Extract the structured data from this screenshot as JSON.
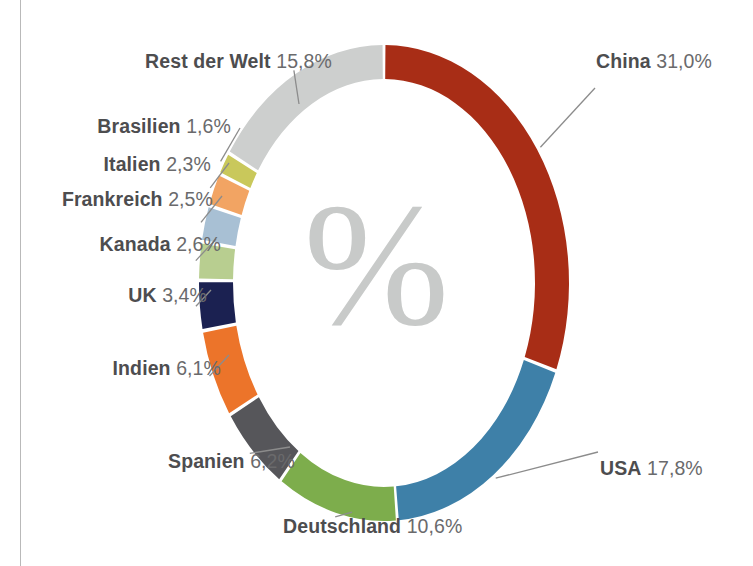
{
  "figure": {
    "center_glyph": "%",
    "background": "#ffffff",
    "rule_color": "#b9b9b9"
  },
  "chart_data": {
    "type": "pie",
    "variant": "donut",
    "title": "",
    "subtitle": "",
    "xlabel": "",
    "ylabel": "",
    "units": "%",
    "decimal_separator": ",",
    "start_angle_deg": 0,
    "direction": "clockwise",
    "inner_radius_ratio": 0.855,
    "total": 100.0,
    "legend": "none (direct labels with leader lines)",
    "grid": false,
    "center_label": "%",
    "categories": [
      "China",
      "USA",
      "Deutschland",
      "Spanien",
      "Indien",
      "UK",
      "Kanada",
      "Frankreich",
      "Italien",
      "Brasilien",
      "Rest der Welt"
    ],
    "values": [
      31.0,
      17.8,
      10.6,
      6.2,
      6.1,
      3.4,
      2.6,
      2.5,
      2.3,
      1.6,
      15.8
    ],
    "colors": [
      "#a82d16",
      "#3e80a8",
      "#7dad4c",
      "#56565a",
      "#ec742a",
      "#1b2151",
      "#b8ce90",
      "#a8c0d4",
      "#f2a463",
      "#c9c85b",
      "#cdcfce"
    ],
    "slices": [
      {
        "name": "China",
        "value": 31.0,
        "value_text": "31,0%",
        "label": "China 31,0%",
        "color": "#a82d16",
        "side": "right"
      },
      {
        "name": "USA",
        "value": 17.8,
        "value_text": "17,8%",
        "label": "USA 17,8%",
        "color": "#3e80a8",
        "side": "right"
      },
      {
        "name": "Deutschland",
        "value": 10.6,
        "value_text": "10,6%",
        "label": "Deutschland 10,6%",
        "color": "#7dad4c",
        "side": "bottom"
      },
      {
        "name": "Spanien",
        "value": 6.2,
        "value_text": "6,2%",
        "label": "Spanien 6,2%",
        "color": "#56565a",
        "side": "left"
      },
      {
        "name": "Indien",
        "value": 6.1,
        "value_text": "6,1%",
        "label": "Indien 6,1%",
        "color": "#ec742a",
        "side": "left"
      },
      {
        "name": "UK",
        "value": 3.4,
        "value_text": "3,4%",
        "label": "UK 3,4%",
        "color": "#1b2151",
        "side": "left"
      },
      {
        "name": "Kanada",
        "value": 2.6,
        "value_text": "2,6%",
        "label": "Kanada 2,6%",
        "color": "#b8ce90",
        "side": "left"
      },
      {
        "name": "Frankreich",
        "value": 2.5,
        "value_text": "2,5%",
        "label": "Frankreich 2,5%",
        "color": "#a8c0d4",
        "side": "left"
      },
      {
        "name": "Italien",
        "value": 2.3,
        "value_text": "2,3%",
        "label": "Italien 2,3%",
        "color": "#f2a463",
        "side": "left"
      },
      {
        "name": "Brasilien",
        "value": 1.6,
        "value_text": "1,6%",
        "label": "Brasilien 1,6%",
        "color": "#c9c85b",
        "side": "left"
      },
      {
        "name": "Rest der Welt",
        "value": 15.8,
        "value_text": "15,8%",
        "label": "Rest der Welt 15,8%",
        "color": "#cdcfce",
        "side": "left"
      }
    ]
  }
}
